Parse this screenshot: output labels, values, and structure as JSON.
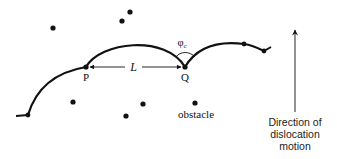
{
  "diagram": {
    "type": "dislocation bowing between obstacles (Orowan / Friedel pinning)",
    "colors": {
      "line": "#111111",
      "background": "#ffffff"
    },
    "labels": {
      "point_p": "P",
      "point_q": "Q",
      "spacing": "L",
      "angle_symbol": "φ",
      "angle_subscript": "c",
      "obstacle": "obstacle",
      "direction_line1": "Direction of",
      "direction_line2": "dislocation",
      "direction_line3": "motion"
    },
    "obstacles_free": [
      {
        "x": 53,
        "y": 28
      },
      {
        "x": 122,
        "y": 21
      },
      {
        "x": 130,
        "y": 12
      },
      {
        "x": 73,
        "y": 102
      },
      {
        "x": 143,
        "y": 104
      },
      {
        "x": 126,
        "y": 116
      },
      {
        "x": 195,
        "y": 103
      }
    ],
    "pinning_points": [
      {
        "name": "start",
        "x": 28,
        "y": 115
      },
      {
        "name": "P",
        "x": 86,
        "y": 67
      },
      {
        "name": "Q",
        "x": 185,
        "y": 67
      },
      {
        "name": "mid-right",
        "x": 244,
        "y": 44
      },
      {
        "name": "end",
        "x": 264,
        "y": 51
      }
    ]
  }
}
